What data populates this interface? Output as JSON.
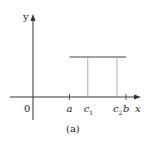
{
  "figure": {
    "caption": "(a)",
    "axes": {
      "x_label": "x",
      "y_label": "y",
      "origin_label": "0"
    },
    "x_points": [
      {
        "name": "a",
        "label": "a",
        "sub": "",
        "value": 1.0,
        "tick": true
      },
      {
        "name": "c1",
        "label": "c",
        "sub": "1",
        "value": 1.5,
        "tick": false
      },
      {
        "name": "c2",
        "label": "c",
        "sub": "2",
        "value": 2.3,
        "tick": false
      },
      {
        "name": "b",
        "label": "b",
        "sub": "",
        "value": 2.55,
        "tick": true
      }
    ],
    "constant_function": {
      "from": "a",
      "to": "b",
      "level": 0.55
    },
    "verticals": [
      "c1",
      "c2"
    ],
    "colors": {
      "axis": "#333333",
      "function_line": "#444444",
      "vertical_lines": "#999999"
    }
  }
}
